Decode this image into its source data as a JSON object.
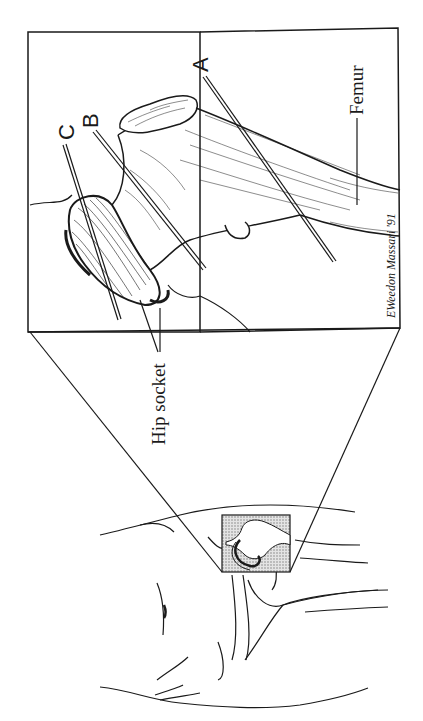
{
  "figure": {
    "orientation": "rotated-90-ccw",
    "colors": {
      "ink": "#1a1a1a",
      "background": "#ffffff",
      "inset_fill": "#c8c8c8"
    },
    "labels": {
      "section_a": "A",
      "section_b": "B",
      "section_c": "C",
      "femur": "Femur",
      "hip_socket": "Hip socket"
    },
    "signature": "EWeedon Massari '91"
  }
}
